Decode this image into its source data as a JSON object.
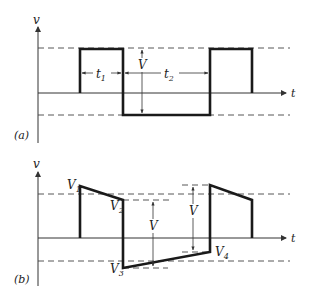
{
  "figure": {
    "panel_a": {
      "label": "(a)",
      "y_axis_label": "v",
      "x_axis_label": "t",
      "amplitude_label": "V",
      "interval_labels": {
        "t1": "t",
        "t1_sub": "1",
        "t2": "t",
        "t2_sub": "2"
      },
      "description": "Square wave alternating between positive and negative levels; t1 = high duration, t2 = low duration, V = peak-to-peak amplitude"
    },
    "panel_b": {
      "label": "(b)",
      "y_axis_label": "v",
      "x_axis_label": "t",
      "amplitude_label_left": "V",
      "amplitude_label_right": "V",
      "points": [
        {
          "name": "V",
          "sub": "1"
        },
        {
          "name": "V",
          "sub": "2"
        },
        {
          "name": "V",
          "sub": "3"
        },
        {
          "name": "V",
          "sub": "4"
        }
      ],
      "description": "Tilted square wave: top decays from V1 to V2, bottom rises from V3 to V4; steps of magnitude V"
    }
  }
}
